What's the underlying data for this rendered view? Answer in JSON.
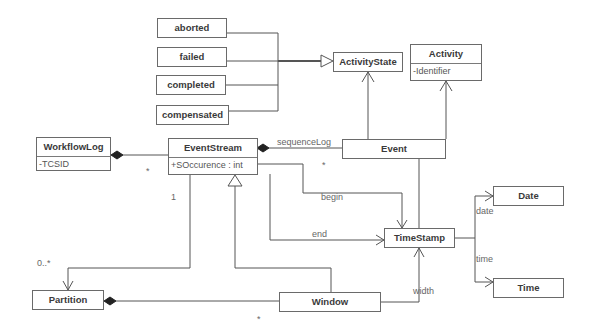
{
  "diagram": {
    "type": "UML class diagram",
    "classes": {
      "aborted": {
        "name": "aborted"
      },
      "failed": {
        "name": "failed"
      },
      "completed": {
        "name": "completed"
      },
      "compensated": {
        "name": "compensated"
      },
      "activity_state": {
        "name": "ActivityState"
      },
      "activity": {
        "name": "Activity",
        "attribute": "-Identifier"
      },
      "workflow_log": {
        "name": "WorkflowLog",
        "attribute": "-TCSID"
      },
      "event_stream": {
        "name": "EventStream",
        "attribute": "+SOccurence : int"
      },
      "event": {
        "name": "Event"
      },
      "timestamp": {
        "name": "TimeStamp"
      },
      "date": {
        "name": "Date"
      },
      "time": {
        "name": "Time"
      },
      "partition": {
        "name": "Partition"
      },
      "window": {
        "name": "Window"
      }
    },
    "labels": {
      "sequence_log": "sequenceLog",
      "begin": "begin",
      "end": "end",
      "date": "date",
      "time": "time",
      "width": "width",
      "mult_one": "1",
      "mult_zero_many": "0..*",
      "mult_star_wl": "*",
      "mult_star_seq": "*",
      "mult_star_win": "*"
    },
    "relationships": [
      {
        "from": "aborted",
        "to": "ActivityState",
        "kind": "generalization"
      },
      {
        "from": "failed",
        "to": "ActivityState",
        "kind": "generalization"
      },
      {
        "from": "completed",
        "to": "ActivityState",
        "kind": "generalization"
      },
      {
        "from": "compensated",
        "to": "ActivityState",
        "kind": "generalization"
      },
      {
        "from": "Event",
        "to": "ActivityState",
        "kind": "association"
      },
      {
        "from": "Event",
        "to": "Activity",
        "kind": "association"
      },
      {
        "from": "WorkflowLog",
        "to": "EventStream",
        "kind": "composition"
      },
      {
        "from": "EventStream",
        "to": "Event",
        "kind": "composition",
        "label": "sequenceLog"
      },
      {
        "from": "EventStream",
        "to": "TimeStamp",
        "kind": "association",
        "label": "begin"
      },
      {
        "from": "EventStream",
        "to": "TimeStamp",
        "kind": "association",
        "label": "end"
      },
      {
        "from": "Event",
        "to": "TimeStamp",
        "kind": "association"
      },
      {
        "from": "EventStream",
        "to": "Partition",
        "kind": "association",
        "multiplicity": [
          "1",
          "0..*"
        ]
      },
      {
        "from": "Window",
        "to": "EventStream",
        "kind": "generalization"
      },
      {
        "from": "Partition",
        "to": "Window",
        "kind": "composition"
      },
      {
        "from": "Window",
        "to": "TimeStamp",
        "kind": "association",
        "label": "width"
      },
      {
        "from": "TimeStamp",
        "to": "Date",
        "kind": "association",
        "label": "date"
      },
      {
        "from": "TimeStamp",
        "to": "Time",
        "kind": "association",
        "label": "time"
      }
    ]
  }
}
